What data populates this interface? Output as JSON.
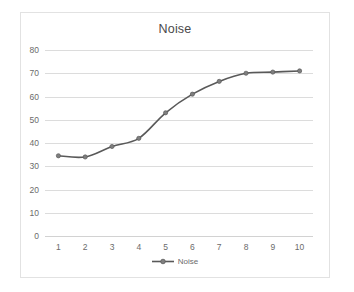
{
  "chart_data": {
    "type": "line",
    "title": "Noise",
    "xlabel": "",
    "ylabel": "",
    "x": [
      1,
      2,
      3,
      4,
      5,
      6,
      7,
      8,
      9,
      10
    ],
    "categories": [
      "1",
      "2",
      "3",
      "4",
      "5",
      "6",
      "7",
      "8",
      "9",
      "10"
    ],
    "series": [
      {
        "name": "Noise",
        "values": [
          34.5,
          34,
          38.5,
          42,
          53,
          61,
          66.5,
          70,
          70.5,
          71
        ],
        "color": "#595959",
        "marker": "circle",
        "line_width": 1.6
      }
    ],
    "ylim": [
      0,
      80
    ],
    "ytick_values": [
      0,
      10,
      20,
      30,
      40,
      50,
      60,
      70,
      80
    ],
    "ytick_labels": [
      "0",
      "10",
      "20",
      "30",
      "40",
      "50",
      "60",
      "70",
      "80"
    ],
    "xtick_labels": [
      "1",
      "2",
      "3",
      "4",
      "5",
      "6",
      "7",
      "8",
      "9",
      "10"
    ],
    "grid": "horizontal",
    "grid_color": "#dcdcdc",
    "legend": {
      "position": "bottom",
      "entries": [
        "Noise"
      ]
    },
    "plot_background": "#ffffff",
    "border_color": "#e2e2e2",
    "tick_label_color": "#6b6b6b",
    "title_color": "#4a4a4a"
  }
}
